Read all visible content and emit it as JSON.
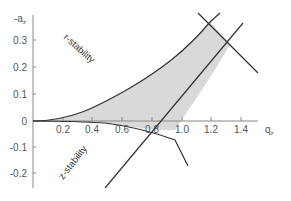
{
  "diagram": {
    "title": "",
    "x_axis": {
      "label": "q",
      "label_sub": "z",
      "ticks": [
        "0.2",
        "0.4",
        "0.6",
        "0.8",
        "1.0",
        "1.2",
        "1.4"
      ]
    },
    "y_axis": {
      "label": "-a",
      "label_sub": "z",
      "ticks": [
        "0.3",
        "0.2",
        "0.1",
        "0",
        "-0.1",
        "-0.2"
      ]
    },
    "regions": {
      "upper_label": "r-stability",
      "lower_label": "z-stability"
    },
    "colors": {
      "stable_region_fill": "#d9d9d9",
      "curve_stroke": "#333333",
      "axis_stroke": "#888888"
    }
  }
}
